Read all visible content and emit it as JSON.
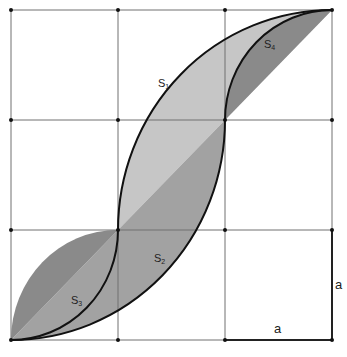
{
  "diagram": {
    "grid": {
      "xs": [
        11,
        118,
        225,
        332
      ],
      "ys": [
        10,
        120,
        230,
        340
      ],
      "line_color": "#6e6e6e",
      "point_color": "#111111"
    },
    "regions": [
      {
        "id": "S1",
        "label": "S",
        "sub": "1",
        "color": "#c6c6c6",
        "x": 162,
        "y": 83
      },
      {
        "id": "S2",
        "label": "S",
        "sub": "2",
        "color": "#a2a2a2",
        "x": 155,
        "y": 258
      },
      {
        "id": "S3",
        "label": "S",
        "sub": "3",
        "color": "#8c8c8c",
        "x": 70,
        "y": 300
      },
      {
        "id": "S4",
        "label": "S",
        "sub": "4",
        "color": "#8c8c8c",
        "x": 264,
        "y": 45
      }
    ],
    "dimension_labels": {
      "horizontal": "a",
      "vertical": "a"
    },
    "colors": {
      "curve": "#111111",
      "diagonal_overlap": "#7e7e7e"
    }
  }
}
